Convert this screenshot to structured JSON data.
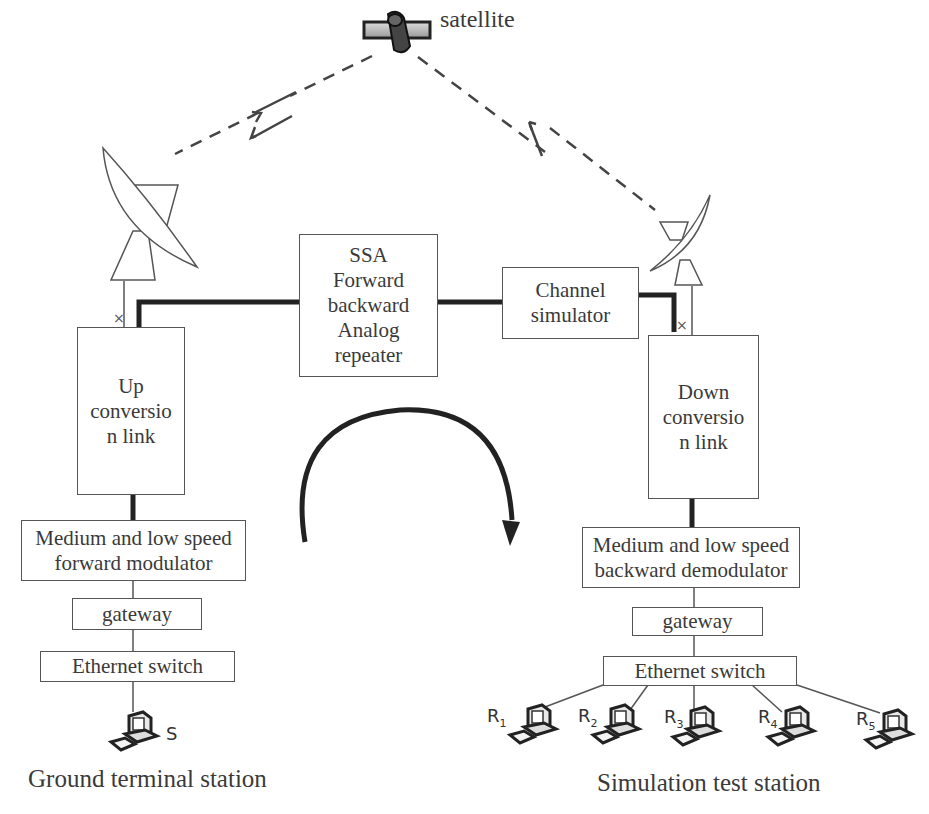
{
  "satellite": {
    "label": "satellite",
    "icon": "satellite-icon"
  },
  "links": {
    "uplink_icon": "lightning-arrow-down-icon",
    "downlink_icon": "lightning-arrow-up-icon"
  },
  "center": {
    "ssa_box": [
      "SSA",
      "Forward",
      "backward",
      "Analog",
      "repeater"
    ],
    "channel_simulator": [
      "Channel",
      "simulator"
    ],
    "loop_arrow_icon": "clockwise-arc-arrow-icon"
  },
  "ground": {
    "antenna_icon": "dish-antenna-icon",
    "up_conversion": [
      "Up",
      "conversio",
      "n link"
    ],
    "modulator": [
      "Medium and low speed",
      "forward modulator"
    ],
    "gateway": "gateway",
    "switch": "Ethernet switch",
    "terminal_label": "S",
    "caption": "Ground terminal station"
  },
  "test": {
    "antenna_icon": "dish-antenna-icon",
    "down_conversion": [
      "Down",
      "conversio",
      "n link"
    ],
    "demodulator": [
      "Medium and low speed",
      "backward demodulator"
    ],
    "gateway": "gateway",
    "switch": "Ethernet switch",
    "receivers": [
      {
        "base": "R",
        "sub": "1"
      },
      {
        "base": "R",
        "sub": "2"
      },
      {
        "base": "R",
        "sub": "3"
      },
      {
        "base": "R",
        "sub": "4"
      },
      {
        "base": "R",
        "sub": "5"
      }
    ],
    "caption": "Simulation test station"
  },
  "colors": {
    "line": "#555555",
    "thick": "#222222",
    "text": "#3a3a3a"
  }
}
